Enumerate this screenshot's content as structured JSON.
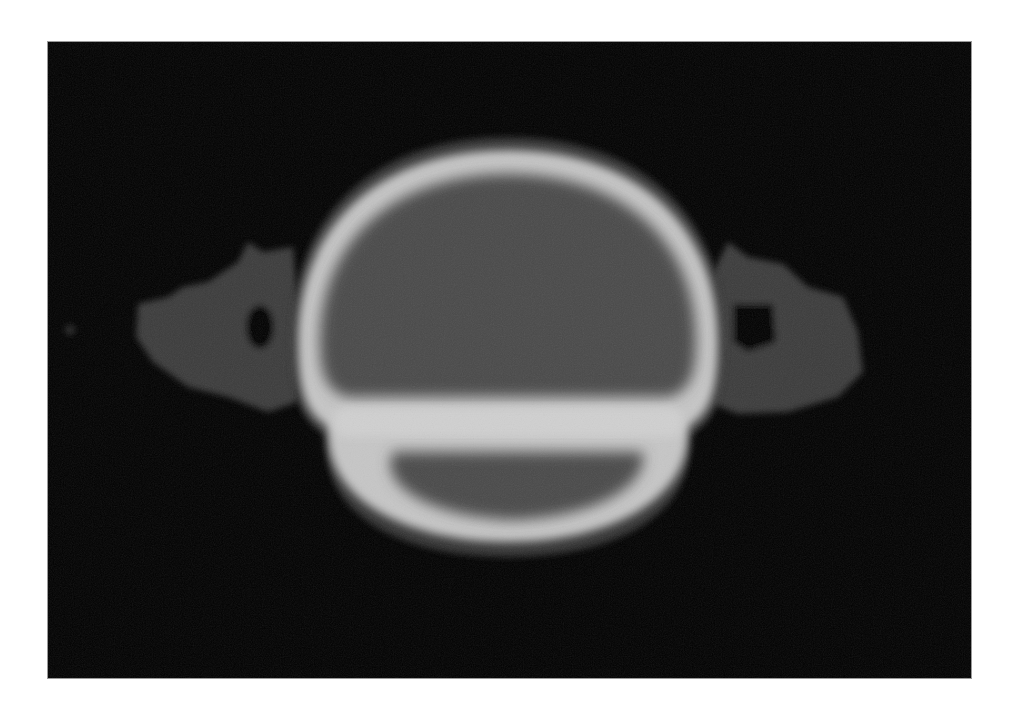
{
  "image": {
    "subject": "CT scan slice of head (coronal view)",
    "background_color": "#000000",
    "page_background": "#ffffff",
    "frame_border_color": "#9a9a9a",
    "tones": {
      "soft_tissue": "#3a3a3a",
      "bone_rim": "#c8c8c8",
      "brain_interior": "#4a4a4a",
      "lower_cavity": "#484848",
      "dark_gap": "#050505"
    }
  }
}
